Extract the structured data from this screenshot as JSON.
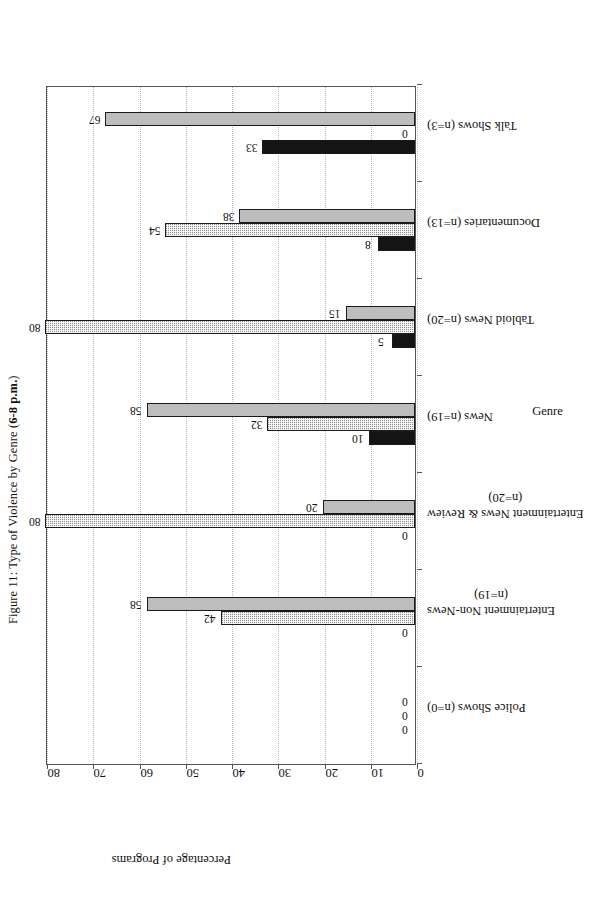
{
  "figure": {
    "title_prefix": "Figure 11: Type of Violence by Genre (",
    "title_bold": "6-8 p.m.",
    "title_suffix": ")"
  },
  "page": {
    "number": ""
  },
  "legend": {
    "position": "top-right",
    "items": [
      {
        "label": "Talk About Violence",
        "swatch": "solid-black-swatch",
        "color": "#141414"
      },
      {
        "label": "Visual Violence",
        "swatch": "checkered-gray-swatch",
        "color": "#8f8f8f"
      },
      {
        "label": "No Violence",
        "swatch": "solid-lightgray-swatch",
        "color": "#bdbdbd"
      }
    ]
  },
  "chart_data": {
    "type": "bar",
    "title": "Figure 11: Type of Violence by Genre (6-8 p.m.)",
    "xlabel": "Genre",
    "ylabel": "Percentage of Programs",
    "ylim": [
      0,
      80
    ],
    "yticks": [
      0,
      10,
      20,
      30,
      40,
      50,
      60,
      70,
      80
    ],
    "grid": false,
    "legend_position": "top-right",
    "categories": [
      "Police Shows (n=0)",
      "Entertainment Non-News (n=19)",
      "Entertainment News & Review (n=20)",
      "News (n=19)",
      "Tabloid News (n=20)",
      "Documentaries (n=13)",
      "Talk Shows (n=3)"
    ],
    "category_lines": [
      [
        "Police Shows (n=0)"
      ],
      [
        "Entertainment Non-News",
        "(n=19)"
      ],
      [
        "Entertainment News & Review",
        "(n=20)"
      ],
      [
        "News (n=19)"
      ],
      [
        "Tabloid News (n=20)"
      ],
      [
        "Documentaries (n=13)"
      ],
      [
        "Talk Shows (n=3)"
      ]
    ],
    "series": [
      {
        "name": "Talk About Violence",
        "color": "#141414",
        "values": [
          0,
          0,
          0,
          10,
          5,
          8,
          33
        ]
      },
      {
        "name": "Visual Violence",
        "color": "#8f8f8f",
        "values": [
          0,
          42,
          80,
          32,
          80,
          54,
          0
        ]
      },
      {
        "name": "No Violence",
        "color": "#bdbdbd",
        "values": [
          0,
          58,
          20,
          58,
          15,
          38,
          67
        ]
      }
    ]
  }
}
